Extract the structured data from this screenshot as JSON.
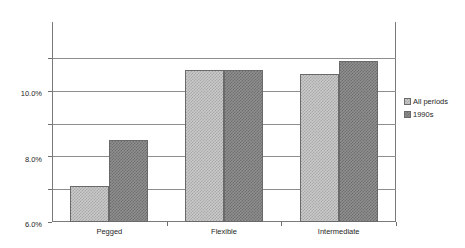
{
  "chart_data": {
    "type": "bar",
    "title": "",
    "xlabel": "",
    "ylabel": "",
    "categories": [
      "Pegged",
      "Flexible",
      "Intermediate"
    ],
    "series": [
      {
        "name": "All periods",
        "values": [
          2.2,
          9.25,
          9.0
        ],
        "color": "#c9c9c9"
      },
      {
        "name": "1990s",
        "values": [
          5.0,
          9.25,
          9.8
        ],
        "color": "#8f8f8f"
      }
    ],
    "ylim": [
      0.0,
      12.2
    ],
    "ytick_values": [
      0.0,
      2.0,
      4.0,
      6.0,
      8.0,
      10.0
    ],
    "ytick_labels": [
      "0.0%",
      "2.0%",
      "4.0%",
      "6.0%",
      "8.0%",
      "10.0%"
    ],
    "grid": true,
    "legend_position": "right",
    "value_suffix": "%"
  }
}
